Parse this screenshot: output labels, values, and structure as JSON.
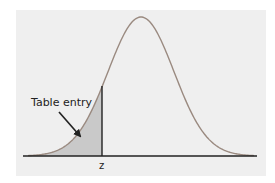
{
  "figure": {
    "annotation_label": "Table entry",
    "axis_label": "z",
    "colors": {
      "background": "#efefef",
      "curve": "#9a8a80",
      "shaded": "#c9c9c9",
      "baseline": "#222222"
    }
  },
  "chart_data": {
    "type": "area",
    "title": "",
    "xlabel": "",
    "ylabel": "",
    "tick_labels": [
      "z"
    ],
    "annotations": [
      {
        "text": "Table entry",
        "points_to": "shaded area left of z"
      }
    ],
    "shaded_region": "left tail up to z (z ≈ -1.2)",
    "grid": false,
    "legend": "none"
  }
}
